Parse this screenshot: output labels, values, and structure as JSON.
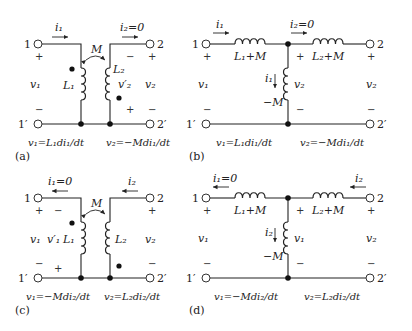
{
  "panels": [
    {
      "id": "a",
      "label": "(a)",
      "type": "coupled-inductors",
      "terminals": [
        "1",
        "1′",
        "2",
        "2′"
      ],
      "current_top_left": "i₁",
      "current_top_right": "i₂=0",
      "mutual": "M",
      "inductor_left": "L₁",
      "inductor_right": "L₂",
      "voltage_left": "v₁",
      "voltage_right": "v₂",
      "induced_voltage": "v′₂",
      "eq_left": "v₁=L₁di₁/dt",
      "eq_right": "v₂=−Mdi₁/dt"
    },
    {
      "id": "b",
      "label": "(b)",
      "type": "t-equivalent",
      "terminals": [
        "1",
        "1′",
        "2",
        "2′"
      ],
      "current_top_left": "i₁",
      "current_top_right": "i₂=0",
      "series_left": "L₁+M",
      "series_right": "L₂+M",
      "shunt": "−M",
      "shunt_current": "i₁",
      "shunt_voltage": "v₂",
      "voltage_left": "v₁",
      "voltage_right": "v₂",
      "eq_left": "v₁=L₁di₁/dt",
      "eq_right": "v₂=−Mdi₁/dt"
    },
    {
      "id": "c",
      "label": "(c)",
      "type": "coupled-inductors",
      "terminals": [
        "1",
        "1′",
        "2",
        "2′"
      ],
      "current_top_left": "i₁=0",
      "current_top_right": "i₂",
      "mutual": "M",
      "inductor_left": "L₁",
      "inductor_right": "L₂",
      "voltage_left": "v₁",
      "voltage_right": "v₂",
      "induced_voltage": "v′₁",
      "eq_left": "v₁=−Mdi₂/dt",
      "eq_right": "v₂=L₂di₂/dt"
    },
    {
      "id": "d",
      "label": "(d)",
      "type": "t-equivalent",
      "terminals": [
        "1",
        "1′",
        "2",
        "2′"
      ],
      "current_top_left": "i₁=0",
      "current_top_right": "i₂",
      "series_left": "L₁+M",
      "series_right": "L₂+M",
      "shunt": "−M",
      "shunt_current": "i₂",
      "shunt_voltage": "v₁",
      "voltage_left": "v₁",
      "voltage_right": "v₂",
      "eq_left": "v₁=−Mdi₂/dt",
      "eq_right": "v₂=L₂di₂/dt"
    }
  ]
}
